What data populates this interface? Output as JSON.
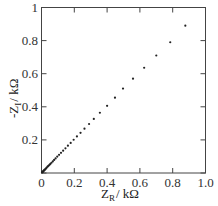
{
  "chart_data": {
    "type": "scatter",
    "title": "",
    "xlabel": "Z_R / kΩ",
    "ylabel": "-Z_I / kΩ",
    "xlim": [
      0,
      1.0
    ],
    "ylim": [
      0,
      1.0
    ],
    "grid": false,
    "legend": null,
    "x_ticks": [
      0,
      0.2,
      0.4,
      0.6,
      0.8,
      1.0
    ],
    "x_tick_labels": [
      "0",
      "0.2",
      "0.4",
      "0.6",
      "0.8",
      "1.0"
    ],
    "y_ticks": [
      0,
      0.2,
      0.4,
      0.6,
      0.8,
      1.0
    ],
    "y_tick_labels": [
      "",
      "0.2",
      "0.4",
      "0.6",
      "0.8",
      "1"
    ],
    "series": [
      {
        "name": "impedance",
        "color": "#222222",
        "x": [
          0.877,
          0.785,
          0.7,
          0.626,
          0.558,
          0.497,
          0.448,
          0.4,
          0.356,
          0.319,
          0.29,
          0.262,
          0.238,
          0.216,
          0.196,
          0.178,
          0.161,
          0.146,
          0.132,
          0.119,
          0.107,
          0.096,
          0.086,
          0.077,
          0.069,
          0.061,
          0.054,
          0.048,
          0.042,
          0.037,
          0.032,
          0.028,
          0.024,
          0.02,
          0.017,
          0.014,
          0.011,
          0.009,
          0.007,
          0.005,
          0.003
        ],
        "y": [
          0.89,
          0.79,
          0.71,
          0.636,
          0.57,
          0.51,
          0.455,
          0.406,
          0.364,
          0.327,
          0.296,
          0.268,
          0.243,
          0.221,
          0.201,
          0.182,
          0.165,
          0.149,
          0.135,
          0.122,
          0.11,
          0.099,
          0.088,
          0.079,
          0.07,
          0.062,
          0.055,
          0.049,
          0.043,
          0.038,
          0.033,
          0.028,
          0.024,
          0.02,
          0.017,
          0.014,
          0.011,
          0.009,
          0.007,
          0.005,
          0.003
        ]
      }
    ]
  },
  "labels": {
    "xlabel_main": "Z",
    "xlabel_sub": "R",
    "xlabel_unit": "/ kΩ",
    "ylabel_prefix": "-Z",
    "ylabel_sub": "I",
    "ylabel_unit": "/ kΩ"
  }
}
